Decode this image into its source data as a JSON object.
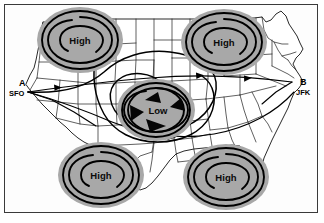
{
  "figure": {
    "kind": "weather-map",
    "region": "Continental United States",
    "frame_border_color": "#3a3a3a",
    "background_color": "#ffffff"
  },
  "legend_colors": {
    "system_fill": "#a8a8a8",
    "system_outline": "#000000",
    "route_line": "#000000",
    "state_border": "#1d1d1d",
    "coastline": "#111111"
  },
  "pressure_systems": [
    {
      "id": "high-northwest",
      "label": "High",
      "type": "high",
      "cx": 80,
      "cy": 40,
      "rx": 43,
      "ry": 33
    },
    {
      "id": "high-northeast",
      "label": "High",
      "type": "high",
      "cx": 224,
      "cy": 42,
      "rx": 43,
      "ry": 33
    },
    {
      "id": "high-southwest",
      "label": "High",
      "type": "high",
      "cx": 101,
      "cy": 175,
      "rx": 43,
      "ry": 33
    },
    {
      "id": "high-southeast",
      "label": "High",
      "type": "high",
      "cx": 226,
      "cy": 177,
      "rx": 43,
      "ry": 33
    },
    {
      "id": "low-center",
      "label": "Low",
      "type": "low",
      "cx": 156,
      "cy": 110,
      "rx": 39,
      "ry": 31
    }
  ],
  "low_rotation": {
    "direction": "counterclockwise",
    "arrow_count": 4
  },
  "waypoints": [
    {
      "id": "origin",
      "letter": "A",
      "code": "SFO",
      "letter_x": 19,
      "letter_y": 86,
      "code_x": 10,
      "code_y": 96
    },
    {
      "id": "destination",
      "letter": "B",
      "code": "JFK",
      "letter_x": 301,
      "letter_y": 85,
      "code_x": 297,
      "code_y": 95
    }
  ],
  "routes": [
    {
      "id": "route-direct-north",
      "description": "Direct great-circle route SFO to JFK passing north of the Low"
    },
    {
      "id": "route-deviation-loop",
      "description": "Deviation route looping around the Low pressure system"
    },
    {
      "id": "route-southern",
      "description": "Southern route curving beneath the Low"
    }
  ]
}
